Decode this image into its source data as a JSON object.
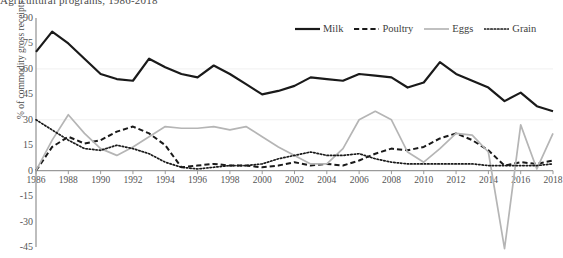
{
  "chart_title": "Agricultural programs, 1986-2018",
  "axes": {
    "y_title": "% of commodity gross receipts",
    "y_ticks": [
      90,
      75,
      60,
      45,
      30,
      15,
      0,
      -15,
      -30,
      -45
    ],
    "x_ticks": [
      1986,
      1988,
      1990,
      1992,
      1994,
      1996,
      1998,
      2000,
      2002,
      2004,
      2006,
      2008,
      2010,
      2012,
      2014,
      2016,
      2018
    ]
  },
  "legend": {
    "position": "top-right",
    "items": [
      {
        "label": "Milk",
        "style": "solid",
        "color": "#1a1a1a",
        "width": 2.2
      },
      {
        "label": "Poultry",
        "style": "dashed",
        "color": "#1a1a1a",
        "width": 2.0
      },
      {
        "label": "Eggs",
        "style": "solid",
        "color": "#b5b5b5",
        "width": 1.7
      },
      {
        "label": "Grain",
        "style": "dotted",
        "color": "#1a1a1a",
        "width": 1.7
      }
    ]
  },
  "chart_data": {
    "type": "line",
    "title": "Agricultural programs, 1986-2018",
    "xlabel": "",
    "ylabel": "% of commodity gross receipts",
    "xlim": [
      1986,
      2018
    ],
    "ylim": [
      -45,
      90
    ],
    "grid": false,
    "legend_position": "top-right",
    "x": [
      1986,
      1987,
      1988,
      1989,
      1990,
      1991,
      1992,
      1993,
      1994,
      1995,
      1996,
      1997,
      1998,
      1999,
      2000,
      2001,
      2002,
      2003,
      2004,
      2005,
      2006,
      2007,
      2008,
      2009,
      2010,
      2011,
      2012,
      2013,
      2014,
      2015,
      2016,
      2017,
      2018
    ],
    "series": [
      {
        "name": "Milk",
        "color": "#1a1a1a",
        "style": "solid",
        "values": [
          70,
          82,
          75,
          66,
          57,
          54,
          53,
          66,
          61,
          57,
          55,
          62,
          57,
          51,
          45,
          47,
          50,
          55,
          54,
          53,
          57,
          56,
          55,
          49,
          52,
          64,
          57,
          53,
          49,
          41,
          46,
          38,
          35
        ]
      },
      {
        "name": "Poultry",
        "color": "#1a1a1a",
        "style": "dashed",
        "values": [
          0,
          14,
          20,
          16,
          18,
          23,
          26,
          22,
          15,
          2,
          3,
          4,
          3,
          3,
          2,
          3,
          5,
          3,
          4,
          3,
          6,
          10,
          13,
          12,
          14,
          19,
          22,
          18,
          12,
          3,
          5,
          4,
          6
        ]
      },
      {
        "name": "Eggs",
        "color": "#b5b5b5",
        "style": "solid",
        "values": [
          0,
          18,
          33,
          22,
          13,
          9,
          14,
          20,
          26,
          25,
          25,
          26,
          24,
          26,
          20,
          14,
          9,
          4,
          4,
          13,
          30,
          35,
          30,
          11,
          5,
          13,
          22,
          21,
          11,
          -46,
          27,
          1,
          22
        ]
      },
      {
        "name": "Grain",
        "color": "#1a1a1a",
        "style": "dotted",
        "values": [
          30,
          24,
          18,
          13,
          12,
          15,
          13,
          10,
          5,
          2,
          1,
          2,
          3,
          3,
          4,
          7,
          9,
          11,
          9,
          9,
          10,
          7,
          5,
          4,
          4,
          4,
          4,
          4,
          3,
          3,
          3,
          3,
          4
        ]
      }
    ]
  }
}
